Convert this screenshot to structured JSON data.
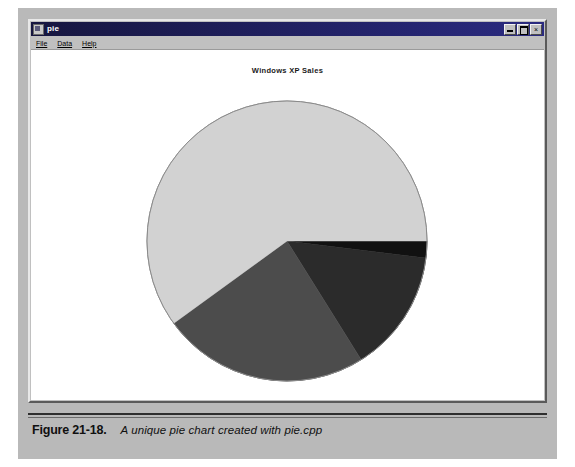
{
  "window": {
    "title": "pie",
    "icon": "app-icon",
    "menu": [
      {
        "label": "File",
        "accel": "F"
      },
      {
        "label": "Data",
        "accel": "D"
      },
      {
        "label": "Help",
        "accel": "H"
      }
    ],
    "controls": [
      {
        "name": "minimize-button",
        "label": "_"
      },
      {
        "name": "maximize-button",
        "label": "□"
      },
      {
        "name": "close-button",
        "label": "×"
      }
    ]
  },
  "caption": {
    "label": "Figure 21-18.",
    "description": "A unique pie chart created with pie.cpp"
  },
  "colors": {
    "slice_1": "#111111",
    "slice_2": "#2b2b2b",
    "slice_3": "#4c4c4c",
    "slice_4": "#d2d2d2",
    "outline": "#8a8a8a",
    "window_face": "#c0c0c0",
    "title_bar": "#24246e",
    "page_background": "#b9b9b9",
    "client_background": "#ffffff"
  },
  "chart_data": {
    "type": "pie",
    "title": "Windows XP Sales",
    "xlabel": "",
    "ylabel": "",
    "grid": false,
    "legend": "none",
    "start_angle_deg": 0,
    "direction": "clockwise",
    "center": {
      "x": 285,
      "y": 228
    },
    "radius": 140,
    "labels": [
      "Slice 1",
      "Slice 2",
      "Slice 3",
      "Slice 4"
    ],
    "values": [
      2,
      14,
      24,
      60
    ],
    "percentages": [
      2,
      14,
      24,
      60
    ],
    "angles_deg": [
      7,
      51,
      86,
      216
    ],
    "colors": [
      "#111111",
      "#2b2b2b",
      "#4c4c4c",
      "#d2d2d2"
    ]
  }
}
